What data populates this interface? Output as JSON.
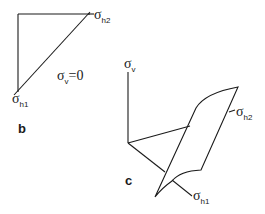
{
  "panels": {
    "b": {
      "label": "b",
      "axis_h1": {
        "symbol": "σ",
        "subscript": "h1"
      },
      "axis_h2": {
        "symbol": "σ",
        "subscript": "h2"
      },
      "condition": {
        "symbol": "σ",
        "subscript": "v",
        "rest": "=0"
      }
    },
    "c": {
      "label": "c",
      "axis_v": {
        "symbol": "σ",
        "subscript": "v"
      },
      "axis_h1": {
        "symbol": "σ",
        "subscript": "h1"
      },
      "axis_h2": {
        "symbol": "σ",
        "subscript": "h2"
      }
    }
  },
  "colors": {
    "ink": "#1a1a1a",
    "background": "#ffffff"
  }
}
